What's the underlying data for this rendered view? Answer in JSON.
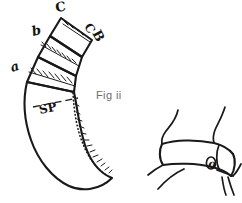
{
  "page": {
    "background_color": "#ffffff",
    "ink_color": "#191919",
    "width": 242,
    "height": 203
  },
  "caption": {
    "text": "Fig ii",
    "color": "#6d6d6d",
    "x": 96,
    "y": 89
  },
  "left_figure": {
    "name": "segmented-curved-band-diagram",
    "labels": [
      {
        "id": "label-a",
        "text": "a",
        "x": 12,
        "y": 72,
        "rotation": -18,
        "size": 13
      },
      {
        "id": "label-b",
        "text": "b",
        "x": 33,
        "y": 36,
        "rotation": -14,
        "size": 13
      },
      {
        "id": "label-c-apex",
        "text": "C",
        "x": 56,
        "y": 12,
        "rotation": -8,
        "size": 13
      },
      {
        "id": "label-c-right",
        "text": "C",
        "x": 84,
        "y": 26,
        "rotation": 62,
        "size": 12
      },
      {
        "id": "label-b-right",
        "text": "B",
        "x": 92,
        "y": 33,
        "rotation": 62,
        "size": 13
      },
      {
        "id": "label-sp",
        "text": "SP",
        "x": 40,
        "y": 114,
        "rotation": -12,
        "size": 12
      }
    ]
  },
  "right_figure": {
    "name": "neck-collar-sketch",
    "labels": [
      {
        "id": "label-o",
        "text": "o",
        "x": 211,
        "y": 166,
        "rotation": 8,
        "size": 11
      }
    ]
  }
}
